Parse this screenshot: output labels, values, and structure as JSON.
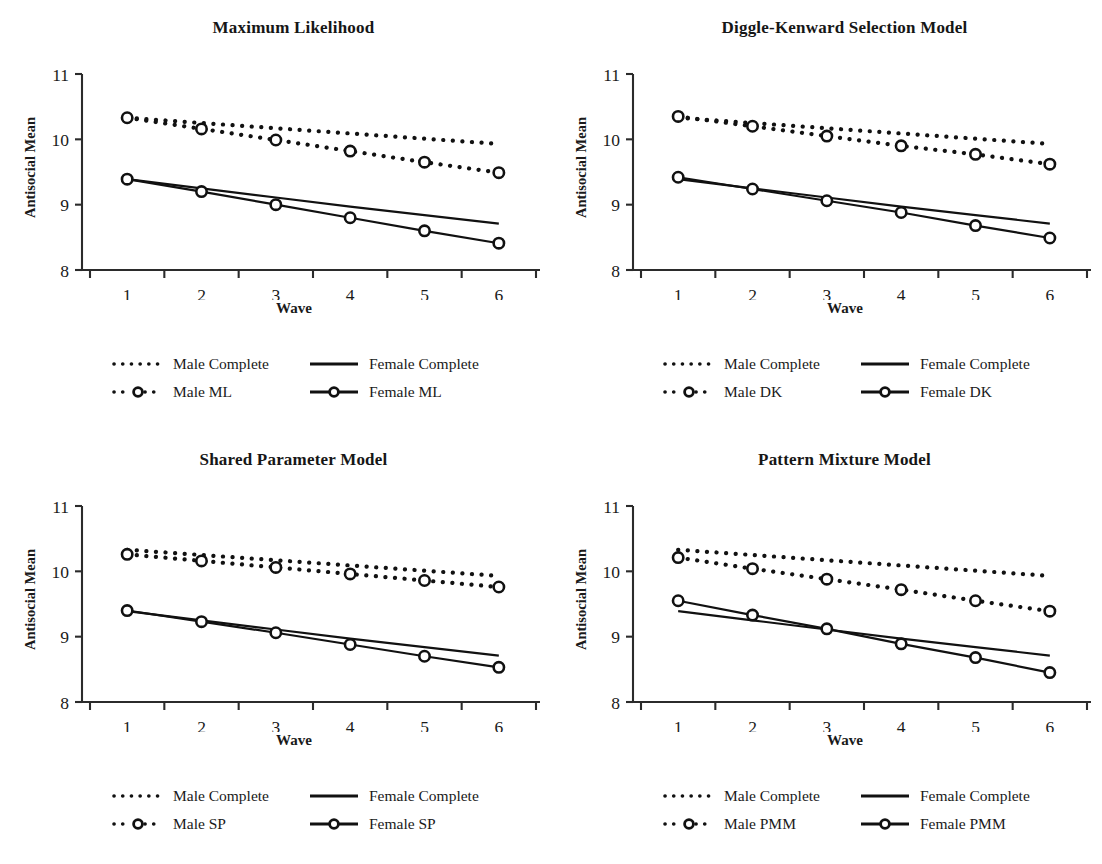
{
  "figure": {
    "panel_count": 4,
    "axis_color": "#2b2b2b",
    "series_color": "#111111"
  },
  "chart_data": [
    {
      "type": "line",
      "title": "Maximum Likelihood",
      "xlabel": "Wave",
      "ylabel": "Antisocial Mean",
      "categories": [
        "1",
        "2",
        "3",
        "4",
        "5",
        "6"
      ],
      "x": [
        1,
        2,
        3,
        4,
        5,
        6
      ],
      "ylim": [
        8,
        11
      ],
      "yticks": [
        8,
        9,
        10,
        11
      ],
      "grid": false,
      "legend_position": "below",
      "series": [
        {
          "name": "Male Complete",
          "style": "dotted",
          "marker": "none",
          "values": [
            10.33,
            10.25,
            10.17,
            10.09,
            10.01,
            9.93
          ]
        },
        {
          "name": "Female Complete",
          "style": "solid",
          "marker": "none",
          "values": [
            9.39,
            9.25,
            9.11,
            8.97,
            8.84,
            8.71
          ]
        },
        {
          "name": "Male ML",
          "style": "dotted",
          "marker": "circle",
          "values": [
            10.33,
            10.16,
            9.99,
            9.82,
            9.65,
            9.49
          ]
        },
        {
          "name": "Female ML",
          "style": "solid",
          "marker": "circle",
          "values": [
            9.39,
            9.2,
            9.0,
            8.8,
            8.6,
            8.41
          ]
        }
      ]
    },
    {
      "type": "line",
      "title": "Diggle-Kenward Selection Model",
      "xlabel": "Wave",
      "ylabel": "Antisocial Mean",
      "categories": [
        "1",
        "2",
        "3",
        "4",
        "5",
        "6"
      ],
      "x": [
        1,
        2,
        3,
        4,
        5,
        6
      ],
      "ylim": [
        8,
        11
      ],
      "yticks": [
        8,
        9,
        10,
        11
      ],
      "grid": false,
      "legend_position": "below",
      "series": [
        {
          "name": "Male Complete",
          "style": "dotted",
          "marker": "none",
          "values": [
            10.33,
            10.25,
            10.17,
            10.09,
            10.01,
            9.93
          ]
        },
        {
          "name": "Female Complete",
          "style": "solid",
          "marker": "none",
          "values": [
            9.39,
            9.25,
            9.11,
            8.97,
            8.84,
            8.71
          ]
        },
        {
          "name": "Male DK",
          "style": "dotted",
          "marker": "circle",
          "values": [
            10.35,
            10.2,
            10.05,
            9.9,
            9.77,
            9.62
          ]
        },
        {
          "name": "Female DK",
          "style": "solid",
          "marker": "circle",
          "values": [
            9.42,
            9.24,
            9.06,
            8.88,
            8.68,
            8.49
          ]
        }
      ]
    },
    {
      "type": "line",
      "title": "Shared Parameter Model",
      "xlabel": "Wave",
      "ylabel": "Antisocial Mean",
      "categories": [
        "1",
        "2",
        "3",
        "4",
        "5",
        "6"
      ],
      "x": [
        1,
        2,
        3,
        4,
        5,
        6
      ],
      "ylim": [
        8,
        11
      ],
      "yticks": [
        8,
        9,
        10,
        11
      ],
      "grid": false,
      "legend_position": "below",
      "series": [
        {
          "name": "Male Complete",
          "style": "dotted",
          "marker": "none",
          "values": [
            10.33,
            10.25,
            10.17,
            10.09,
            10.01,
            9.93
          ]
        },
        {
          "name": "Female Complete",
          "style": "solid",
          "marker": "none",
          "values": [
            9.39,
            9.25,
            9.11,
            8.97,
            8.84,
            8.71
          ]
        },
        {
          "name": "Male SP",
          "style": "dotted",
          "marker": "circle",
          "values": [
            10.26,
            10.16,
            10.06,
            9.96,
            9.86,
            9.76
          ]
        },
        {
          "name": "Female SP",
          "style": "solid",
          "marker": "circle",
          "values": [
            9.4,
            9.23,
            9.06,
            8.88,
            8.7,
            8.53
          ]
        }
      ]
    },
    {
      "type": "line",
      "title": "Pattern Mixture Model",
      "xlabel": "Wave",
      "ylabel": "Antisocial Mean",
      "categories": [
        "1",
        "2",
        "3",
        "4",
        "5",
        "6"
      ],
      "x": [
        1,
        2,
        3,
        4,
        5,
        6
      ],
      "ylim": [
        8,
        11
      ],
      "yticks": [
        8,
        9,
        10,
        11
      ],
      "grid": false,
      "legend_position": "below",
      "series": [
        {
          "name": "Male Complete",
          "style": "dotted",
          "marker": "none",
          "values": [
            10.33,
            10.25,
            10.17,
            10.09,
            10.01,
            9.93
          ]
        },
        {
          "name": "Female Complete",
          "style": "solid",
          "marker": "none",
          "values": [
            9.39,
            9.25,
            9.11,
            8.97,
            8.84,
            8.71
          ]
        },
        {
          "name": "Male PMM",
          "style": "dotted",
          "marker": "circle",
          "values": [
            10.21,
            10.04,
            9.88,
            9.72,
            9.55,
            9.39
          ]
        },
        {
          "name": "Female PMM",
          "style": "solid",
          "marker": "circle",
          "values": [
            9.55,
            9.33,
            9.12,
            8.89,
            8.68,
            8.45
          ]
        }
      ]
    }
  ],
  "panels": [
    {
      "title": "Maximum Likelihood",
      "ylabel": "Antisocial Mean",
      "xlabel": "Wave",
      "yticks": [
        "11",
        "10",
        "9",
        "8"
      ],
      "xticks": [
        "1",
        "2",
        "3",
        "4",
        "5",
        "6"
      ],
      "legend": [
        {
          "label": "Male Complete",
          "key": "dotted-line-key"
        },
        {
          "label": "Female Complete",
          "key": "solid-line-key"
        },
        {
          "label": "Male ML",
          "key": "dotted-circle-key"
        },
        {
          "label": "Female ML",
          "key": "solid-circle-key"
        }
      ]
    },
    {
      "title": "Diggle-Kenward Selection Model",
      "ylabel": "Antisocial Mean",
      "xlabel": "Wave",
      "yticks": [
        "11",
        "10",
        "9",
        "8"
      ],
      "xticks": [
        "1",
        "2",
        "3",
        "4",
        "5",
        "6"
      ],
      "legend": [
        {
          "label": "Male Complete",
          "key": "dotted-line-key"
        },
        {
          "label": "Female Complete",
          "key": "solid-line-key"
        },
        {
          "label": "Male DK",
          "key": "dotted-circle-key"
        },
        {
          "label": "Female DK",
          "key": "solid-circle-key"
        }
      ]
    },
    {
      "title": "Shared Parameter Model",
      "ylabel": "Antisocial Mean",
      "xlabel": "Wave",
      "yticks": [
        "11",
        "10",
        "9",
        "8"
      ],
      "xticks": [
        "1",
        "2",
        "3",
        "4",
        "5",
        "6"
      ],
      "legend": [
        {
          "label": "Male Complete",
          "key": "dotted-line-key"
        },
        {
          "label": "Female Complete",
          "key": "solid-line-key"
        },
        {
          "label": "Male SP",
          "key": "dotted-circle-key"
        },
        {
          "label": "Female SP",
          "key": "solid-circle-key"
        }
      ]
    },
    {
      "title": "Pattern Mixture Model",
      "ylabel": "Antisocial Mean",
      "xlabel": "Wave",
      "yticks": [
        "11",
        "10",
        "9",
        "8"
      ],
      "xticks": [
        "1",
        "2",
        "3",
        "4",
        "5",
        "6"
      ],
      "legend": [
        {
          "label": "Male Complete",
          "key": "dotted-line-key"
        },
        {
          "label": "Female Complete",
          "key": "solid-line-key"
        },
        {
          "label": "Male PMM",
          "key": "dotted-circle-key"
        },
        {
          "label": "Female PMM",
          "key": "solid-circle-key"
        }
      ]
    }
  ]
}
